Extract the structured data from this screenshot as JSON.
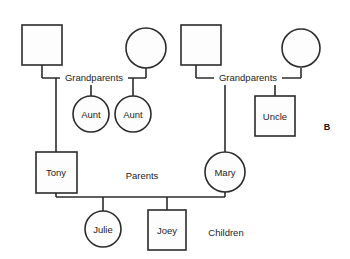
{
  "figure": {
    "panel_letter": "B",
    "colors": {
      "background": "#ffffff",
      "stroke": "#2b2b2b",
      "shape_fill": "#fdfdfd",
      "text": "#1d1d1d"
    }
  },
  "group_labels": {
    "grandparents_left": "Grandparents",
    "grandparents_right": "Grandparents",
    "parents": "Parents",
    "children": "Children"
  },
  "nodes": {
    "grandfather_left": {
      "label": "",
      "shape": "square"
    },
    "grandmother_left": {
      "label": "",
      "shape": "circle"
    },
    "grandfather_right": {
      "label": "",
      "shape": "square"
    },
    "grandmother_right": {
      "label": "",
      "shape": "circle"
    },
    "aunt_one": {
      "label": "Aunt",
      "shape": "circle"
    },
    "aunt_two": {
      "label": "Aunt",
      "shape": "circle"
    },
    "uncle": {
      "label": "Uncle",
      "shape": "square"
    },
    "tony": {
      "label": "Tony",
      "shape": "square"
    },
    "mary": {
      "label": "Mary",
      "shape": "circle"
    },
    "julie": {
      "label": "Julie",
      "shape": "circle"
    },
    "joey": {
      "label": "Joey",
      "shape": "square"
    }
  }
}
